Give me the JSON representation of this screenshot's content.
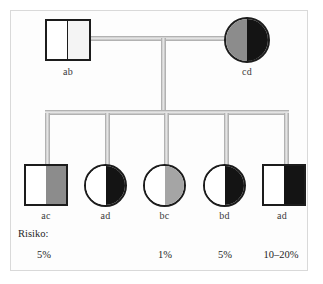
{
  "figure": {
    "type": "pedigree-chart",
    "frame_color": "#d9d9d9",
    "line_color": "#c3c3c3",
    "outline_color": "#1c1c1c"
  },
  "generation_1": {
    "father": {
      "label": "ab",
      "shape": "square",
      "sex": "male",
      "left_fill": "#ffffff",
      "right_fill": "#f4f4f4",
      "divider": true
    },
    "mother": {
      "label": "cd",
      "shape": "circle",
      "sex": "female",
      "left_fill": "#8c8c8c",
      "right_fill": "#141414",
      "divider": false
    }
  },
  "generation_2": [
    {
      "label": "ac",
      "shape": "square",
      "sex": "male",
      "left_fill": "#ffffff",
      "right_fill": "#8c8c8c",
      "divider": false
    },
    {
      "label": "ad",
      "shape": "circle",
      "sex": "female",
      "left_fill": "#ffffff",
      "right_fill": "#141414",
      "divider": false
    },
    {
      "label": "bc",
      "shape": "circle",
      "sex": "female",
      "left_fill": "#ffffff",
      "right_fill": "#a5a5a5",
      "divider": false
    },
    {
      "label": "bd",
      "shape": "circle",
      "sex": "female",
      "left_fill": "#ffffff",
      "right_fill": "#141414",
      "divider": false
    },
    {
      "label": "ad",
      "shape": "square",
      "sex": "male",
      "left_fill": "#ffffff",
      "right_fill": "#141414",
      "divider": false
    }
  ],
  "risk_row": {
    "title": "Risiko:",
    "values": [
      "5%",
      "",
      "1%",
      "5%",
      "10–20%"
    ]
  }
}
